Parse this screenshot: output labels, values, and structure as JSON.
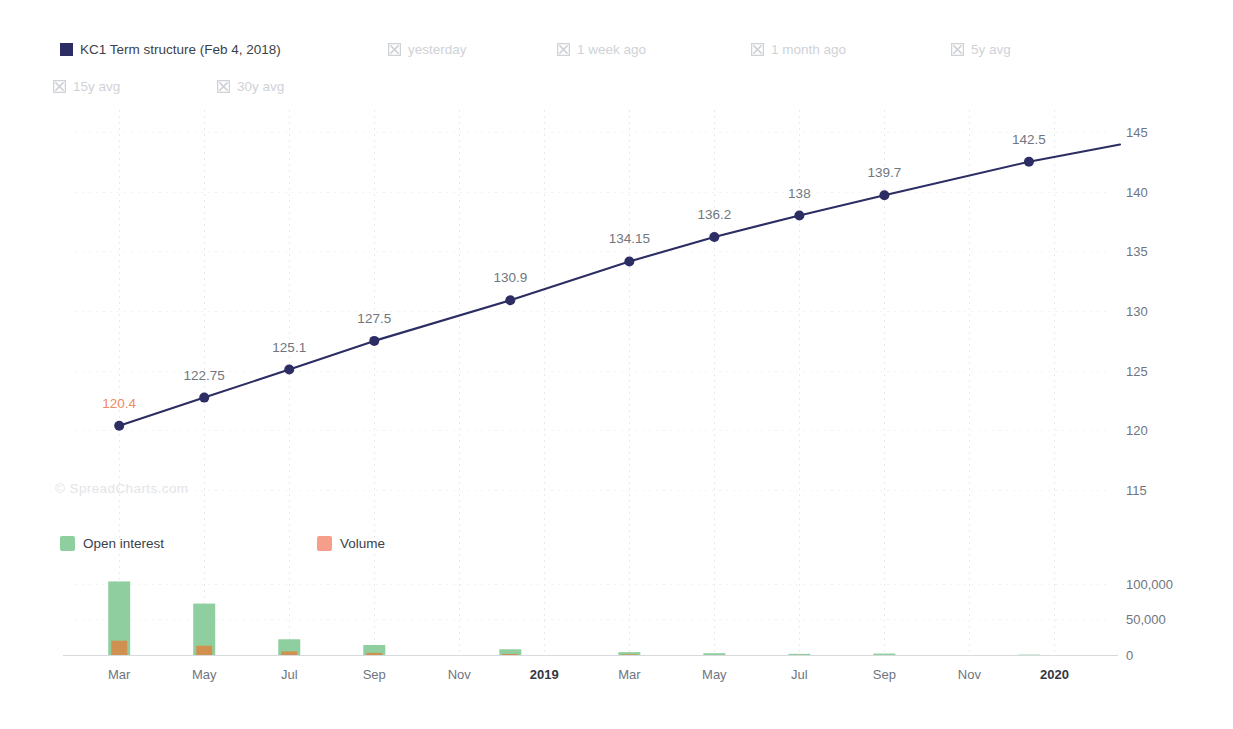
{
  "series_legend": [
    {
      "label": "KC1 Term structure (Feb 4, 2018)",
      "state": "active",
      "icon": "color-swatch",
      "color": "#2b2d63",
      "x": 60,
      "y": 43
    },
    {
      "label": "yesterday",
      "state": "inactive",
      "icon": "x-box-icon",
      "color": "#cfd2d6",
      "x": 388,
      "y": 43
    },
    {
      "label": "1 week ago",
      "state": "inactive",
      "icon": "x-box-icon",
      "color": "#cfd2d6",
      "x": 557,
      "y": 43
    },
    {
      "label": "1 month ago",
      "state": "inactive",
      "icon": "x-box-icon",
      "color": "#cfd2d6",
      "x": 751,
      "y": 43
    },
    {
      "label": "5y avg",
      "state": "inactive",
      "icon": "x-box-icon",
      "color": "#cfd2d6",
      "x": 951,
      "y": 43
    },
    {
      "label": "15y avg",
      "state": "inactive",
      "icon": "x-box-icon",
      "color": "#cfd2d6",
      "x": 53,
      "y": 80
    },
    {
      "label": "30y avg",
      "state": "inactive",
      "icon": "x-box-icon",
      "color": "#cfd2d6",
      "x": 217,
      "y": 80
    }
  ],
  "volume_legend": [
    {
      "label": "Open interest",
      "color": "#8fce9e"
    },
    {
      "label": "Volume",
      "color": "#f79e8a"
    }
  ],
  "watermark": "© SpreadCharts.com",
  "colors": {
    "line": "#2b2d63",
    "marker": "#2b2d63",
    "label": "#707680",
    "label_highlight": "#f08a5f",
    "open_interest": "#8fce9e",
    "volume": "#cf9050",
    "grid": "#e9eaec",
    "axis": "#d7d9dd"
  },
  "chart_data": {
    "type": "line",
    "title": "KC1 Term structure (Feb 4, 2018)",
    "xlabel": "",
    "ylabel": "",
    "grid": true,
    "legend_position": "top",
    "price_axis": {
      "side": "right",
      "ticks": [
        115,
        120,
        125,
        130,
        135,
        140,
        145
      ],
      "tick_labels": [
        "115",
        "120",
        "125",
        "130",
        "135",
        "140",
        "145"
      ],
      "ylim": [
        112.5,
        146.5
      ]
    },
    "volume_axis": {
      "side": "right",
      "ticks": [
        0,
        50000,
        100000
      ],
      "tick_labels": [
        "0",
        "50,000",
        "100,000"
      ],
      "ylim": [
        0,
        112000
      ]
    },
    "x_tick_labels": [
      "Mar",
      "May",
      "Jul",
      "Sep",
      "Nov",
      "2019",
      "Mar",
      "May",
      "Jul",
      "Sep",
      "Nov",
      "2020"
    ],
    "x_tick_bold": [
      false,
      false,
      false,
      false,
      false,
      true,
      false,
      false,
      false,
      false,
      false,
      true
    ],
    "categories": [
      "Mar",
      "May",
      "Jul",
      "Sep",
      "Dec",
      "Mar",
      "May",
      "Jul",
      "Sep",
      "Dec"
    ],
    "series": [
      {
        "name": "KC1 Term structure (Feb 4, 2018)",
        "type": "line",
        "color": "#2b2d63",
        "values": [
          120.4,
          122.75,
          125.1,
          127.5,
          130.9,
          134.15,
          136.2,
          138,
          139.7,
          142.5
        ],
        "point_labels": [
          "120.4",
          "122.75",
          "125.1",
          "127.5",
          "130.9",
          "134.15",
          "136.2",
          "138",
          "139.7",
          "142.5"
        ],
        "label_highlight_index": 0
      },
      {
        "name": "Open interest",
        "type": "bar",
        "color": "#8fce9e",
        "values": [
          103000,
          72000,
          22000,
          14000,
          8000,
          4000,
          2500,
          1600,
          2000,
          600
        ]
      },
      {
        "name": "Volume",
        "type": "bar",
        "color": "#cf9050",
        "values": [
          20000,
          13000,
          5000,
          3000,
          1500,
          900,
          500,
          400,
          400,
          200
        ]
      }
    ]
  }
}
